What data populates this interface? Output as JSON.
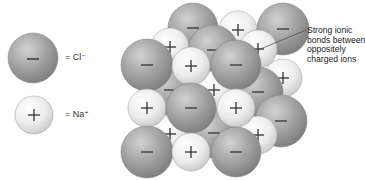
{
  "legend": {
    "chloride": {
      "symbol": "−",
      "label": "= Cl⁻",
      "ion": "chloride-ion"
    },
    "sodium": {
      "symbol": "+",
      "label": "= Na⁺",
      "ion": "sodium-ion"
    }
  },
  "callout": {
    "lines": [
      "Strong ionic",
      "bonds between",
      "oppositely",
      "charged ions"
    ]
  },
  "colors": {
    "chloride_fill": "#9a9a9a",
    "chloride_highlight": "#cfcfcf",
    "sodium_fill": "#e6e6e6",
    "sodium_highlight": "#ffffff",
    "outline": "#8a8a8a",
    "symbol": "#333333"
  },
  "lattice": {
    "spheres": [
      {
        "ion": "cl",
        "x": 193,
        "y": 28,
        "r": 25
      },
      {
        "ion": "na",
        "x": 238,
        "y": 30,
        "r": 19
      },
      {
        "ion": "cl",
        "x": 283,
        "y": 29,
        "r": 26
      },
      {
        "ion": "na",
        "x": 170,
        "y": 47,
        "r": 19
      },
      {
        "ion": "cl",
        "x": 213,
        "y": 50,
        "r": 25
      },
      {
        "ion": "na",
        "x": 258,
        "y": 49,
        "r": 19
      },
      {
        "ion": "na",
        "x": 283,
        "y": 78,
        "r": 19
      },
      {
        "ion": "cl",
        "x": 170,
        "y": 90,
        "r": 25
      },
      {
        "ion": "na",
        "x": 214,
        "y": 90,
        "r": 19
      },
      {
        "ion": "cl",
        "x": 258,
        "y": 92,
        "r": 25
      },
      {
        "ion": "cl",
        "x": 281,
        "y": 121,
        "r": 26
      },
      {
        "ion": "na",
        "x": 170,
        "y": 134,
        "r": 19
      },
      {
        "ion": "cl",
        "x": 214,
        "y": 133,
        "r": 25
      },
      {
        "ion": "na",
        "x": 258,
        "y": 135,
        "r": 19
      },
      {
        "ion": "cl",
        "x": 147,
        "y": 65,
        "r": 26
      },
      {
        "ion": "na",
        "x": 191,
        "y": 66,
        "r": 19
      },
      {
        "ion": "cl",
        "x": 236,
        "y": 65,
        "r": 25
      },
      {
        "ion": "na",
        "x": 147,
        "y": 108,
        "r": 19
      },
      {
        "ion": "cl",
        "x": 191,
        "y": 108,
        "r": 25
      },
      {
        "ion": "na",
        "x": 236,
        "y": 108,
        "r": 19
      },
      {
        "ion": "cl",
        "x": 147,
        "y": 152,
        "r": 26
      },
      {
        "ion": "na",
        "x": 191,
        "y": 152,
        "r": 19
      },
      {
        "ion": "cl",
        "x": 236,
        "y": 152,
        "r": 25
      }
    ]
  }
}
